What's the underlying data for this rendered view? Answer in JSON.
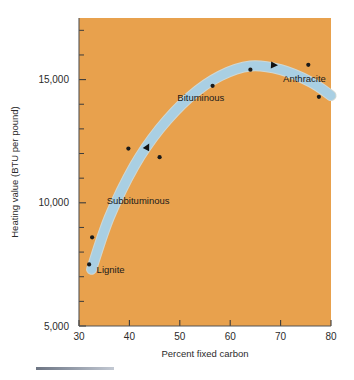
{
  "figure": {
    "plot_background_color": "#e8a14d",
    "band_color": "#a9cfe3",
    "point_color": "#1a1a1a",
    "axis_color": "#555555"
  },
  "chart_data": {
    "type": "scatter",
    "title": "",
    "xlabel": "Percent fixed carbon",
    "ylabel": "Heating value (BTU per pound)",
    "xlim": [
      30,
      80
    ],
    "ylim": [
      5000,
      17500
    ],
    "grid": false,
    "legend_position": "none",
    "x_ticks": [
      30,
      40,
      50,
      60,
      70,
      80
    ],
    "x_tick_labels": [
      "30",
      "40",
      "50",
      "60",
      "70",
      "80"
    ],
    "y_ticks": [
      5000,
      10000,
      15000
    ],
    "y_tick_labels": [
      "5,000",
      "10,000",
      "15,000"
    ],
    "y_minor_ticks": [
      6000,
      7000,
      8000,
      9000,
      11000,
      12000,
      13000,
      14000,
      16000,
      17000
    ],
    "points": [
      {
        "x": 32.0,
        "y": 7500,
        "group": "Lignite"
      },
      {
        "x": 32.6,
        "y": 8600,
        "group": "Lignite"
      },
      {
        "x": 39.8,
        "y": 12200,
        "group": "Subbituminous"
      },
      {
        "x": 46.0,
        "y": 11850,
        "group": "Subbituminous"
      },
      {
        "x": 56.5,
        "y": 14750,
        "group": "Bituminous"
      },
      {
        "x": 64.0,
        "y": 15400,
        "group": "Bituminous"
      },
      {
        "x": 75.5,
        "y": 15600,
        "group": "Anthracite"
      },
      {
        "x": 77.6,
        "y": 14300,
        "group": "Anthracite"
      }
    ],
    "trend_band": {
      "description": "Light blue band showing coal rank progression rising then falling",
      "path_points": [
        {
          "x": 32.5,
          "y": 7300
        },
        {
          "x": 36.0,
          "y": 9400
        },
        {
          "x": 41.0,
          "y": 11500
        },
        {
          "x": 46.0,
          "y": 13000
        },
        {
          "x": 52.0,
          "y": 14300
        },
        {
          "x": 58.0,
          "y": 15150
        },
        {
          "x": 64.0,
          "y": 15550
        },
        {
          "x": 70.0,
          "y": 15400
        },
        {
          "x": 76.0,
          "y": 14900
        },
        {
          "x": 80.0,
          "y": 14350
        }
      ]
    },
    "annotations": [
      {
        "label": "Lignite",
        "x": 33.5,
        "y": 7150,
        "name": "lignite-label"
      },
      {
        "label": "Subbituminous",
        "x": 35.5,
        "y": 9950,
        "name": "subbituminous-label"
      },
      {
        "label": "Bituminous",
        "x": 49.5,
        "y": 14150,
        "name": "bituminous-label"
      },
      {
        "label": "Anthracite",
        "x": 70.5,
        "y": 14900,
        "name": "anthracite-label"
      }
    ],
    "direction_arrows": [
      {
        "x": 43.0,
        "y": 12050,
        "angle": -62,
        "name": "lower-direction-arrow"
      },
      {
        "x": 67.5,
        "y": 15600,
        "angle": 3,
        "name": "upper-direction-arrow"
      }
    ]
  }
}
